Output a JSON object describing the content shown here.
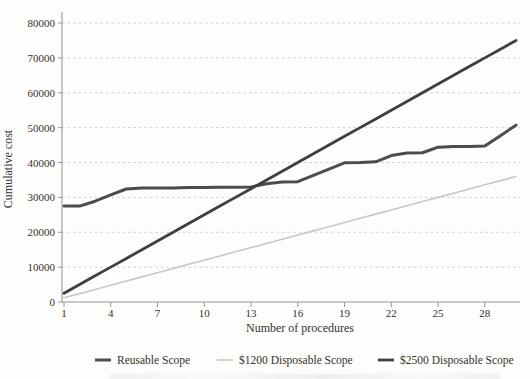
{
  "figure": {
    "background": "#fdfdfb",
    "text_color": "#35322b"
  },
  "chart_data": {
    "type": "line",
    "xlabel": "Number of procedures",
    "ylabel": "Cumulative cost",
    "x": [
      1,
      2,
      3,
      4,
      5,
      6,
      7,
      8,
      9,
      10,
      11,
      12,
      13,
      14,
      15,
      16,
      17,
      18,
      19,
      20,
      21,
      22,
      23,
      24,
      25,
      26,
      27,
      28,
      29,
      30
    ],
    "xlim": [
      1,
      30
    ],
    "ylim": [
      0,
      80000
    ],
    "xticks": [
      1,
      4,
      7,
      10,
      13,
      16,
      19,
      22,
      25,
      28
    ],
    "yticks": [
      0,
      10000,
      20000,
      30000,
      40000,
      50000,
      60000,
      70000,
      80000
    ],
    "grid": "horizontal-dotted",
    "legend_position": "bottom",
    "series": [
      {
        "name": "Reusable Scope",
        "color": "#4e4c48",
        "width": 3,
        "values": [
          27500,
          27500,
          28900,
          30700,
          32400,
          32700,
          32700,
          32700,
          32800,
          32800,
          32900,
          32900,
          33000,
          33900,
          34400,
          34500,
          36300,
          38100,
          39900,
          40000,
          40200,
          42000,
          42700,
          42800,
          44400,
          44600,
          44600,
          44700,
          47700,
          50700
        ]
      },
      {
        "name": "$1200 Disposable Scope",
        "color": "#c9c8c4",
        "width": 1.6,
        "values": [
          1200,
          2400,
          3600,
          4800,
          6000,
          7200,
          8400,
          9600,
          10800,
          12000,
          13200,
          14400,
          15600,
          16800,
          18000,
          19200,
          20400,
          21600,
          22800,
          24000,
          25200,
          26400,
          27600,
          28800,
          30000,
          31200,
          32400,
          33600,
          34800,
          36000
        ]
      },
      {
        "name": "$2500 Disposable Scope",
        "color": "#413f3b",
        "width": 2.8,
        "values": [
          2500,
          5000,
          7500,
          10000,
          12500,
          15000,
          17500,
          20000,
          22500,
          25000,
          27500,
          30000,
          32500,
          35000,
          37500,
          40000,
          42500,
          45000,
          47500,
          50000,
          52500,
          55000,
          57500,
          60000,
          62500,
          65000,
          67500,
          70000,
          72500,
          75000
        ]
      }
    ]
  }
}
